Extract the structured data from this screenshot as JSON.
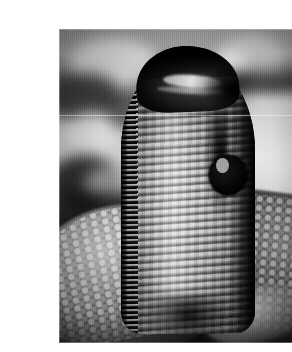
{
  "page": {
    "background_color": "#ffffff",
    "width": 292,
    "height": 352
  },
  "photo": {
    "caption": "",
    "subject": "cobra with spread hood rearing up",
    "alt_text": "Black and white photograph of a cobra rearing upright with its hood fully spread, coiled body visible below against a blurred background",
    "color_mode": "grayscale",
    "frame": {
      "left": 19,
      "top": 13,
      "width": 258,
      "height": 314
    },
    "palette": {
      "highlight": "#e2e2e2",
      "midtone": "#8d8d8d",
      "shadow": "#141414",
      "background_light": "#c9c9c9",
      "background_dark": "#2a2a2a"
    },
    "regions": {
      "head": "dark hooded head with pale snout streak and dark eye",
      "hood": "flared hood with horizontal scale banding and braided left rim",
      "coil_left": "speckled pale scales on coiled body, lower left",
      "coil_right": "dark coiled body with light speckles, lower right",
      "background": "blurred bokeh foliage, light wash at right, dark band upper right"
    }
  }
}
